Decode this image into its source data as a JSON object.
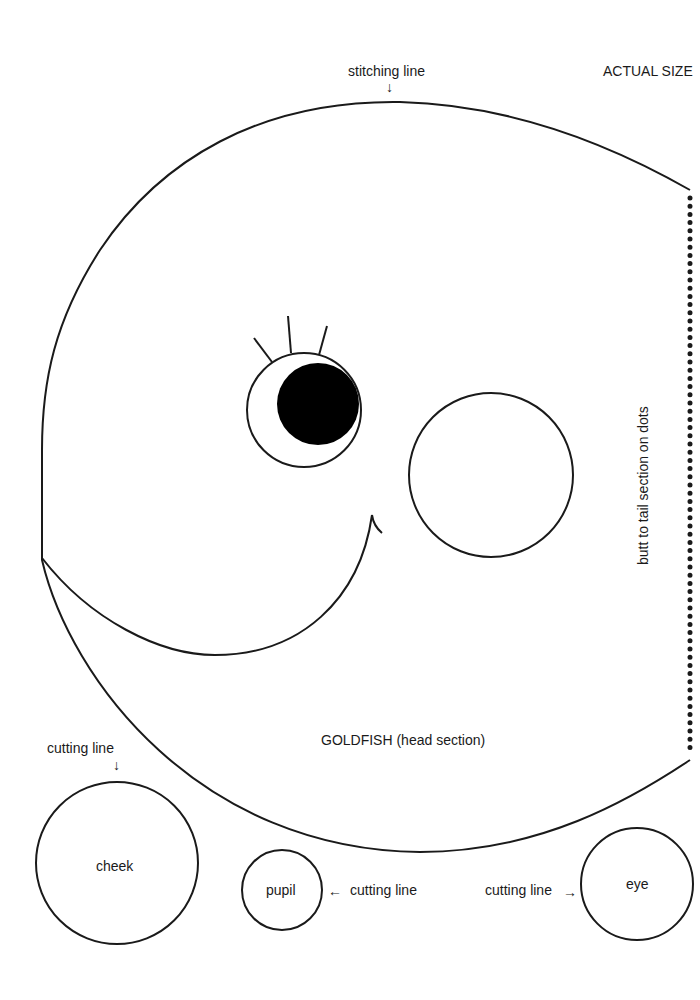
{
  "page": {
    "header": {
      "stitching_label": "stitching line",
      "stitching_arrow": "↓",
      "scale_note": "ACTUAL SIZE"
    },
    "side_note": "butt to tail section on dots",
    "piece_title": "GOLDFISH (head section)",
    "small_pieces": {
      "cheek": {
        "label": "cheek",
        "cut_label": "cutting line",
        "cut_arrow": "↓"
      },
      "pupil": {
        "label": "pupil",
        "cut_label": "cutting line",
        "cut_arrow": "←"
      },
      "eye": {
        "label": "eye",
        "cut_label": "cutting line",
        "cut_arrow": "→"
      }
    },
    "colors": {
      "ink": "#1a1a1a",
      "paper": "#ffffff"
    }
  }
}
